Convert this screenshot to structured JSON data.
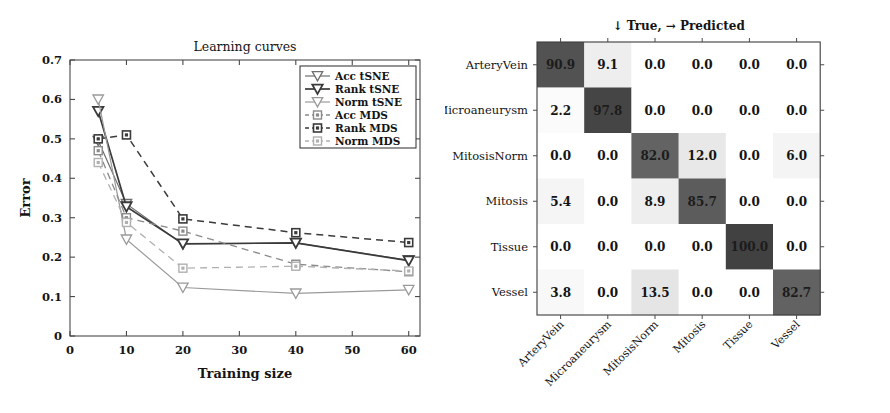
{
  "chart_data": [
    {
      "id": "learning-curves",
      "type": "line",
      "title": "Learning curves",
      "xlabel": "Training size",
      "ylabel": "Error",
      "xlim": [
        0,
        62
      ],
      "ylim": [
        0,
        0.7
      ],
      "xticks": [
        0,
        10,
        20,
        30,
        40,
        50,
        60
      ],
      "xticklabels": [
        "0",
        "10",
        "20",
        "30",
        "40",
        "50",
        "60"
      ],
      "yticks": [
        0,
        0.1,
        0.2,
        0.3,
        0.4,
        0.5,
        0.6,
        0.7
      ],
      "yticklabels": [
        "0",
        "0.1",
        "0.2",
        "0.3",
        "0.4",
        "0.5",
        "0.6",
        "0.7"
      ],
      "x": [
        5,
        10,
        20,
        40,
        60
      ],
      "grid": false,
      "legend_position": "upper right",
      "series": [
        {
          "name": "Acc tSNE",
          "values": [
            0.495,
            0.335,
            0.233,
            0.236,
            0.192
          ],
          "color": "#6e6e6e",
          "dash": "none",
          "marker": "triangle-down",
          "width": 1.2
        },
        {
          "name": "Rank tSNE",
          "values": [
            0.57,
            0.328,
            0.234,
            0.236,
            0.191
          ],
          "color": "#3a3a3a",
          "dash": "none",
          "marker": "triangle-down",
          "width": 1.7
        },
        {
          "name": "Norm tSNE",
          "values": [
            0.6,
            0.245,
            0.123,
            0.108,
            0.117
          ],
          "color": "#9a9a9a",
          "dash": "none",
          "marker": "triangle-down",
          "width": 1.2
        },
        {
          "name": "Acc MDS",
          "values": [
            0.47,
            0.3,
            0.266,
            0.182,
            0.163
          ],
          "color": "#8a8a8a",
          "dash": "7,5",
          "marker": "square",
          "width": 1.3
        },
        {
          "name": "Rank MDS",
          "values": [
            0.5,
            0.51,
            0.297,
            0.262,
            0.237
          ],
          "color": "#3a3a3a",
          "dash": "7,5",
          "marker": "square",
          "width": 1.5
        },
        {
          "name": "Norm MDS",
          "values": [
            0.44,
            0.288,
            0.172,
            0.177,
            0.165
          ],
          "color": "#b0b0b0",
          "dash": "7,5",
          "marker": "square",
          "width": 1.3
        }
      ]
    },
    {
      "id": "confusion-matrix",
      "type": "heatmap",
      "title": "↓ True, → Predicted",
      "xlabel": "",
      "ylabel": "",
      "row_labels": [
        "ArteryVein",
        "Microaneurysm",
        "MitosisNorm",
        "Mitosis",
        "Tissue",
        "Vessel"
      ],
      "col_labels": [
        "ArteryVein",
        "Microaneurysm",
        "MitosisNorm",
        "Mitosis",
        "Tissue",
        "Vessel"
      ],
      "vmin": 0,
      "vmax": 100,
      "colormap": "gray-reversed",
      "values": [
        [
          90.9,
          9.1,
          0.0,
          0.0,
          0.0,
          0.0
        ],
        [
          2.2,
          97.8,
          0.0,
          0.0,
          0.0,
          0.0
        ],
        [
          0.0,
          0.0,
          82.0,
          12.0,
          0.0,
          6.0
        ],
        [
          5.4,
          0.0,
          8.9,
          85.7,
          0.0,
          0.0
        ],
        [
          0.0,
          0.0,
          0.0,
          0.0,
          100.0,
          0.0
        ],
        [
          3.8,
          0.0,
          13.5,
          0.0,
          0.0,
          82.7
        ]
      ],
      "cell_text": [
        [
          "90.9",
          "9.1",
          "0.0",
          "0.0",
          "0.0",
          "0.0"
        ],
        [
          "2.2",
          "97.8",
          "0.0",
          "0.0",
          "0.0",
          "0.0"
        ],
        [
          "0.0",
          "0.0",
          "82.0",
          "12.0",
          "0.0",
          "6.0"
        ],
        [
          "5.4",
          "0.0",
          "8.9",
          "85.7",
          "0.0",
          "0.0"
        ],
        [
          "0.0",
          "0.0",
          "0.0",
          "0.0",
          "100.0",
          "0.0"
        ],
        [
          "3.8",
          "0.0",
          "13.5",
          "0.0",
          "0.0",
          "82.7"
        ]
      ]
    }
  ],
  "figure": {
    "background": "#ffffff",
    "axis_color": "#4a4a4a",
    "text_color": "#141414"
  }
}
